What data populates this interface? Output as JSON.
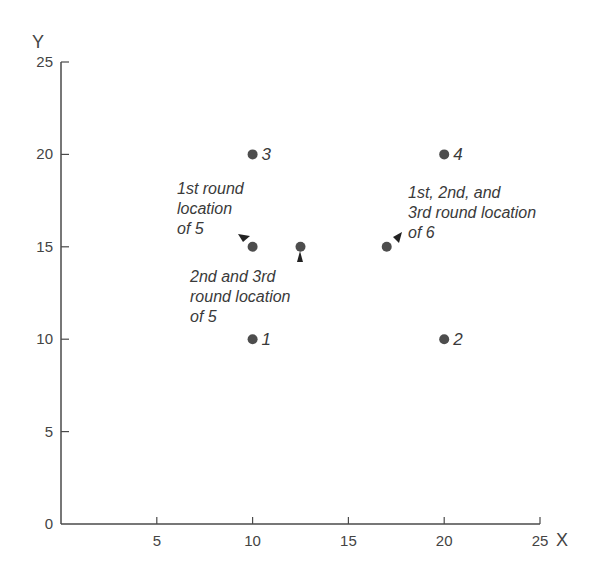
{
  "chart_data": {
    "type": "scatter",
    "title": "",
    "xlabel": "X",
    "ylabel": "Y",
    "xlim": [
      0,
      25
    ],
    "ylim": [
      0,
      25
    ],
    "grid": false,
    "legend": null,
    "x_ticks": [
      "5",
      "10",
      "15",
      "20",
      "25"
    ],
    "y_ticks": [
      "0",
      "5",
      "10",
      "15",
      "20",
      "25"
    ],
    "points": [
      {
        "label": "1",
        "x": 10,
        "y": 10
      },
      {
        "label": "2",
        "x": 20,
        "y": 10
      },
      {
        "label": "3",
        "x": 10,
        "y": 20
      },
      {
        "label": "4",
        "x": 20,
        "y": 20
      },
      {
        "label": "",
        "x": 10,
        "y": 15
      },
      {
        "label": "",
        "x": 12.5,
        "y": 15
      },
      {
        "label": "",
        "x": 17,
        "y": 15
      }
    ],
    "annotations": [
      {
        "id": "first-round-5",
        "lines": [
          "1st round",
          "location",
          "of 5"
        ],
        "points_to": {
          "x": 10,
          "y": 15
        }
      },
      {
        "id": "second-third-round-5",
        "lines": [
          "2nd and 3rd",
          "round location",
          "of 5"
        ],
        "points_to": {
          "x": 12.5,
          "y": 15
        }
      },
      {
        "id": "all-rounds-6",
        "lines": [
          "1st, 2nd, and",
          "3rd round location",
          "of 6"
        ],
        "points_to": {
          "x": 17,
          "y": 15
        }
      }
    ]
  },
  "colors": {
    "axis": "#4a4a4a",
    "point": "#4d4d4d",
    "text": "#3a3a3a"
  }
}
